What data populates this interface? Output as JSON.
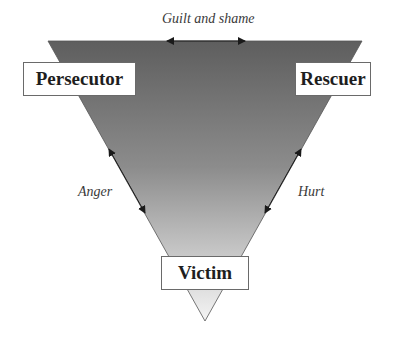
{
  "diagram": {
    "roles": {
      "persecutor": "Persecutor",
      "rescuer": "Rescuer",
      "victim": "Victim"
    },
    "relations": {
      "top": "Guilt and shame",
      "left": "Anger",
      "right": "Hurt"
    },
    "colors": {
      "triangle_top": "#5e5e5e",
      "triangle_bottom": "#f2f2f2",
      "box_border": "#6a6a6a",
      "text": "#1e1e1e"
    }
  }
}
